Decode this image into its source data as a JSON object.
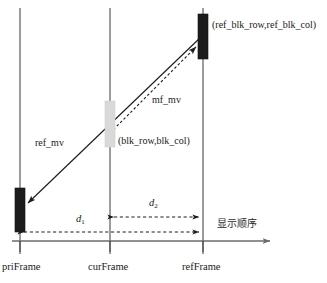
{
  "diagram": {
    "type": "timeline-motion-vector-diagram",
    "axis": {
      "label": "显示顺序",
      "direction": "left-to-right",
      "y": 241,
      "x_start": 12,
      "x_end": 276
    },
    "frames": [
      {
        "id": "priFrame",
        "label": "priFrame",
        "x": 20,
        "block": {
          "name": "pri-block",
          "fill": "#1c1c1c",
          "x": 15,
          "y": 188,
          "width": 10,
          "height": 44
        }
      },
      {
        "id": "curFrame",
        "label": "curFrame",
        "x": 110,
        "block": {
          "name": "cur-block",
          "fill": "#d9d9d9",
          "x": 105,
          "y": 101,
          "width": 10,
          "height": 46
        }
      },
      {
        "id": "refFrame",
        "label": "refFrame",
        "x": 203,
        "block": {
          "name": "ref-block",
          "fill": "#1c1c1c",
          "x": 198,
          "y": 14,
          "width": 10,
          "height": 45
        }
      }
    ],
    "vectors": [
      {
        "id": "ref_mv",
        "label": "ref_mv",
        "style": "solid",
        "from": {
          "x": 203,
          "y": 36
        },
        "to": {
          "x": 26,
          "y": 205
        },
        "arrow_at": "to",
        "label_pos": {
          "x": 35,
          "y": 144
        }
      },
      {
        "id": "mf_mv",
        "label": "mf_mv",
        "style": "dashed",
        "from": {
          "x": 110,
          "y": 132
        },
        "to": {
          "x": 198,
          "y": 46
        },
        "arrow_at": "to",
        "label_pos": {
          "x": 152,
          "y": 100
        }
      }
    ],
    "measures": [
      {
        "id": "d2",
        "label": "d",
        "subscript": "2",
        "style": "dashed-double-arrow",
        "y": 217,
        "x_from": 110,
        "x_to": 203,
        "label_pos": {
          "x": 149,
          "y": 200
        }
      },
      {
        "id": "d1",
        "label": "d",
        "subscript": "1",
        "style": "dashed-double-arrow",
        "y": 232,
        "x_from": 20,
        "x_to": 203,
        "label_pos": {
          "x": 76,
          "y": 216
        }
      }
    ],
    "annotations": [
      {
        "id": "ref-blk-coord",
        "text": "(ref_blk_row,ref_blk_col)",
        "x": 212,
        "y": 26
      },
      {
        "id": "blk-coord",
        "text": "(blk_row,blk_col)",
        "x": 118,
        "y": 142
      }
    ],
    "colors": {
      "block_dark": "#1c1c1c",
      "block_light": "#d9d9d9",
      "line": "#2a2a2a",
      "axis": "#6b6b6b",
      "text": "#1a1a1a"
    }
  }
}
